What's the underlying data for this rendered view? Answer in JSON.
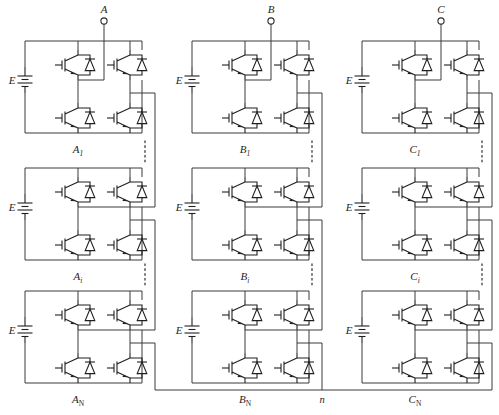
{
  "figure": {
    "type": "circuit-schematic",
    "background": "#ffffff",
    "wire_color": "#3a3a3a",
    "device_color": "#1f1f1f"
  },
  "terminals": [
    {
      "name": "phase-a-terminal",
      "label": "A"
    },
    {
      "name": "phase-b-terminal",
      "label": "B"
    },
    {
      "name": "phase-c-terminal",
      "label": "C"
    }
  ],
  "neutral": {
    "label": "n",
    "name": "neutral-point"
  },
  "source_label": "E",
  "cells": [
    {
      "phase": "A",
      "row": 1,
      "label_main": "A",
      "label_sub": "1"
    },
    {
      "phase": "B",
      "row": 1,
      "label_main": "B",
      "label_sub": "1"
    },
    {
      "phase": "C",
      "row": 1,
      "label_main": "C",
      "label_sub": "1"
    },
    {
      "phase": "A",
      "row": 2,
      "label_main": "A",
      "label_sub": "i"
    },
    {
      "phase": "B",
      "row": 2,
      "label_main": "B",
      "label_sub": "i"
    },
    {
      "phase": "C",
      "row": 2,
      "label_main": "C",
      "label_sub": "i"
    },
    {
      "phase": "A",
      "row": 3,
      "label_main": "A",
      "label_sub": "N"
    },
    {
      "phase": "B",
      "row": 3,
      "label_main": "B",
      "label_sub": "N"
    },
    {
      "phase": "C",
      "row": 3,
      "label_main": "C",
      "label_sub": "N"
    }
  ],
  "cell_labels": {
    "a1_main": "A",
    "a1_sub": "1",
    "b1_main": "B",
    "b1_sub": "1",
    "c1_main": "C",
    "c1_sub": "1",
    "ai_main": "A",
    "ai_sub": "i",
    "bi_main": "B",
    "bi_sub": "i",
    "ci_main": "C",
    "ci_sub": "i",
    "aN_main": "A",
    "aN_sub": "N",
    "bN_main": "B",
    "bN_sub": "N",
    "cN_main": "C",
    "cN_sub": "N"
  },
  "source_labels": {
    "e_a1": "E",
    "e_b1": "E",
    "e_c1": "E",
    "e_ai": "E",
    "e_bi": "E",
    "e_ci": "E",
    "e_aN": "E",
    "e_bN": "E",
    "e_cN": "E"
  },
  "ellipses": [
    {
      "name": "ellipsis-phase-a-upper",
      "orientation": "vertical"
    },
    {
      "name": "ellipsis-phase-b-upper",
      "orientation": "vertical"
    },
    {
      "name": "ellipsis-phase-c-upper",
      "orientation": "vertical"
    },
    {
      "name": "ellipsis-phase-a-lower",
      "orientation": "vertical"
    },
    {
      "name": "ellipsis-phase-b-lower",
      "orientation": "vertical"
    },
    {
      "name": "ellipsis-phase-c-lower",
      "orientation": "vertical"
    }
  ],
  "devices": {
    "type": "IGBT with anti-parallel diode",
    "per_cell": 4,
    "total": 36
  }
}
